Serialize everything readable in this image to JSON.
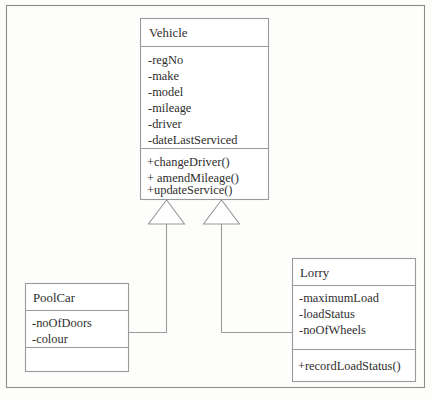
{
  "diagram": {
    "type": "uml-class-diagram",
    "notation": "UML generalization (inheritance)",
    "background_color": "#fdfdfb",
    "line_color": "#9a9a9a",
    "text_color": "#2e2e2e",
    "classes": [
      {
        "id": "vehicle",
        "name": "Vehicle",
        "role": "superclass",
        "attributes": [
          "-regNo",
          "-make",
          "-model",
          "-mileage",
          "-driver",
          "-dateLastServiced"
        ],
        "operations": [
          "+changeDriver()",
          "+ amendMileage()",
          "+updateService()"
        ]
      },
      {
        "id": "poolcar",
        "name": "PoolCar",
        "role": "subclass",
        "attributes": [
          "-noOfDoors",
          "-colour"
        ],
        "operations": []
      },
      {
        "id": "lorry",
        "name": "Lorry",
        "role": "subclass",
        "attributes": [
          "-maximumLoad",
          "-loadStatus",
          "-noOfWheels"
        ],
        "operations": [
          "+recordLoadStatus()"
        ]
      }
    ],
    "relationships": [
      {
        "id": "gen-poolcar",
        "type": "generalization",
        "from": "PoolCar",
        "to": "Vehicle",
        "arrowhead": "hollow-triangle"
      },
      {
        "id": "gen-lorry",
        "type": "generalization",
        "from": "Lorry",
        "to": "Vehicle",
        "arrowhead": "hollow-triangle"
      }
    ]
  }
}
